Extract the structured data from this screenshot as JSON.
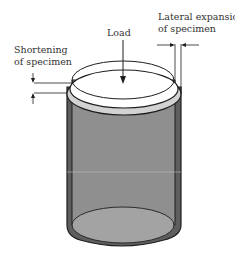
{
  "diagram": {
    "labels": {
      "load": "Load",
      "shortening_line1": "Shortening",
      "shortening_line2": "of specimen",
      "lateral_line1": "Lateral expansion",
      "lateral_line2": "of specimen"
    },
    "colors": {
      "outline": "#1e1e1e",
      "body_fill": "#8c8c8c",
      "side_dark": "#5a5a5a",
      "top_face": "#ffffff",
      "top_band": "#cfcfcf",
      "bottom_face": "#a0a0a0",
      "text": "#333333"
    }
  }
}
